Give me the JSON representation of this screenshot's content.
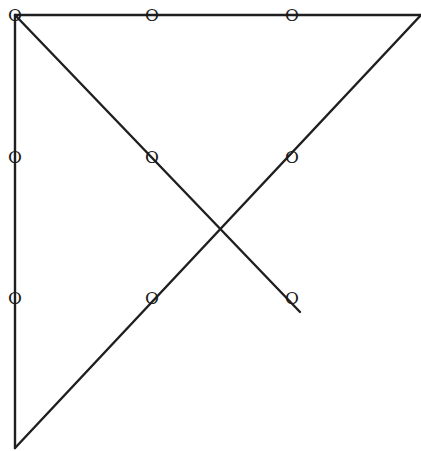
{
  "diagram": {
    "width": 421,
    "height": 451,
    "stroke_color": "#1f1f1f",
    "background": "#ffffff",
    "nodes": [
      {
        "id": "r1c1",
        "label": "O",
        "x": 15,
        "y": 15
      },
      {
        "id": "r1c2",
        "label": "O",
        "x": 152,
        "y": 15
      },
      {
        "id": "r1c3",
        "label": "O",
        "x": 292,
        "y": 15
      },
      {
        "id": "r2c1",
        "label": "O",
        "x": 15,
        "y": 157
      },
      {
        "id": "r2c2",
        "label": "O",
        "x": 152,
        "y": 157
      },
      {
        "id": "r2c3",
        "label": "O",
        "x": 292,
        "y": 157
      },
      {
        "id": "r3c1",
        "label": "O",
        "x": 15,
        "y": 298
      },
      {
        "id": "r3c2",
        "label": "O",
        "x": 152,
        "y": 298
      },
      {
        "id": "r3c3",
        "label": "O",
        "x": 292,
        "y": 298
      }
    ],
    "lines": [
      {
        "id": "top-horizontal",
        "x1": 15,
        "y1": 15,
        "x2": 421,
        "y2": 15
      },
      {
        "id": "left-vertical",
        "x1": 15,
        "y1": 15,
        "x2": 15,
        "y2": 448
      },
      {
        "id": "rising-diagonal",
        "x1": 15,
        "y1": 448,
        "x2": 421,
        "y2": 15
      },
      {
        "id": "falling-diagonal",
        "x1": 15,
        "y1": 15,
        "x2": 300,
        "y2": 312
      }
    ]
  }
}
